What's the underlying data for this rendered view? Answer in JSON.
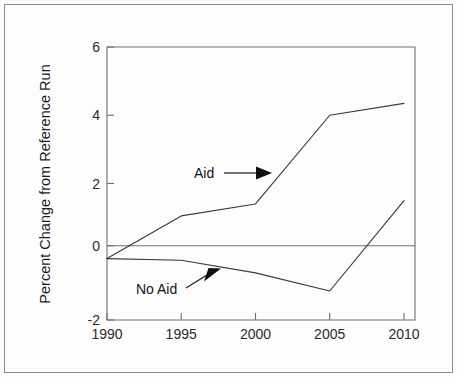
{
  "chart_data": {
    "type": "line",
    "title": "",
    "xlabel": "",
    "ylabel": "Percent Change from Reference Run",
    "x": [
      1990,
      1995,
      2000,
      2005,
      2010
    ],
    "xlim": [
      1990,
      2010
    ],
    "ylim": [
      -2,
      6
    ],
    "xticks": [
      1990,
      1995,
      2000,
      2005,
      2010
    ],
    "yticks": [
      -2,
      0,
      2,
      4,
      6
    ],
    "xtick_labels": [
      "1990",
      "1995",
      "2000",
      "2005",
      "2010"
    ],
    "ytick_labels": [
      "-2",
      "0",
      "2",
      "4",
      "6"
    ],
    "grid": false,
    "legend": "none",
    "zero_line": 0,
    "series": [
      {
        "name": "Aid",
        "values": [
          -0.2,
          1.05,
          1.4,
          4.0,
          4.35
        ],
        "color": "#3a3a3a"
      },
      {
        "name": "No Aid",
        "values": [
          -0.2,
          -0.25,
          -0.62,
          -1.15,
          1.5
        ],
        "color": "#3a3a3a"
      }
    ],
    "annotations": [
      {
        "text": "Aid",
        "label_x": 1997.3,
        "label_y": 2.08,
        "arrow_from_x": 1998.6,
        "arrow_from_y": 2.08,
        "arrow_to_x": 2001.1,
        "arrow_to_y": 2.08,
        "style": "horizontal-arrow"
      },
      {
        "text": "No Aid",
        "label_x": 1993.2,
        "label_y": -1.12,
        "arrow_from_x": 1996.2,
        "arrow_from_y": -1.0,
        "arrow_to_x": 1998.4,
        "arrow_to_y": -0.6,
        "style": "diagonal-arrow"
      }
    ]
  },
  "figure": {
    "background_color": "#fdfdfd",
    "frame_color": "#8c8c8c",
    "axis_color": "#6e6e6e",
    "line_color": "#3a3a3a",
    "text_color": "#1c1c1c"
  }
}
